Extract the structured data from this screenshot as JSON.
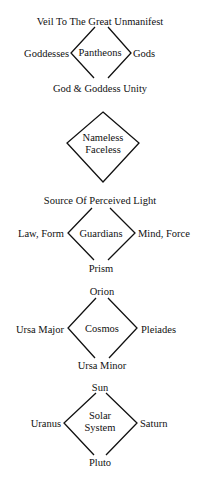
{
  "diagrams": [
    {
      "name": "pantheons",
      "center": "Pantheons",
      "top": "Veil To The Great Unmanifest",
      "left": "Goddesses",
      "right": "Gods",
      "bottom": "God & Goddess Unity"
    },
    {
      "name": "nameless",
      "center_line1": "Nameless",
      "center_line2": "Faceless"
    },
    {
      "name": "guardians",
      "center": "Guardians",
      "top": "Source Of Perceived Light",
      "left": "Law, Form",
      "right": "Mind, Force",
      "bottom": "Prism"
    },
    {
      "name": "cosmos",
      "center": "Cosmos",
      "top": "Orion",
      "left": "Ursa Major",
      "right": "Pleiades",
      "bottom": "Ursa Minor"
    },
    {
      "name": "solar-system",
      "center_line1": "Solar",
      "center_line2": "System",
      "top": "Sun",
      "left": "Uranus",
      "right": "Saturn",
      "bottom": "Pluto"
    }
  ],
  "colors": {
    "line": "#111111",
    "text": "#111111",
    "background": "#ffffff"
  }
}
